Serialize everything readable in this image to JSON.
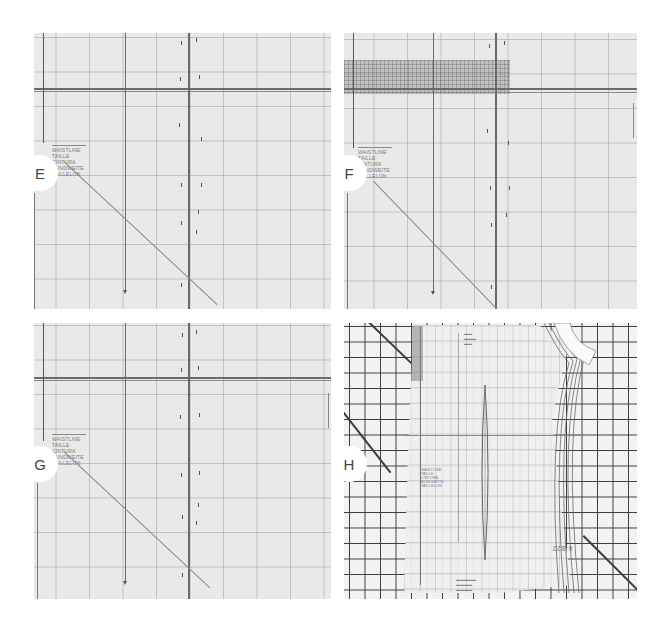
{
  "panels": [
    {
      "id": "E",
      "badge_label": "E",
      "pattern_labels": [
        "WAISTLINE",
        "TAILLE",
        "CINTURA",
        "BUNDWEITE",
        "TAILLELIJN"
      ]
    },
    {
      "id": "F",
      "badge_label": "F",
      "pattern_labels": [
        "WAISTLINE",
        "TAILLE",
        "CINTURA",
        "BUNDWEITE",
        "TAILLELIJN"
      ]
    },
    {
      "id": "G",
      "badge_label": "G",
      "pattern_labels": [
        "WAISTLINE",
        "TAILLE",
        "CINTURA",
        "BUNDWEITE",
        "TAILLELIJN"
      ]
    },
    {
      "id": "H",
      "badge_label": "H",
      "pattern_labels": [
        "WAISTLINE",
        "TAILLE",
        "CINTURA",
        "BUNDWEITE",
        "TAILLELIJN"
      ],
      "piece_number": "6-822"
    }
  ],
  "colors": {
    "background": "#ffffff",
    "paper": "#e9e9e9",
    "grid_line": "#3c3c3c",
    "pattern_line": "#6a6a6a"
  }
}
